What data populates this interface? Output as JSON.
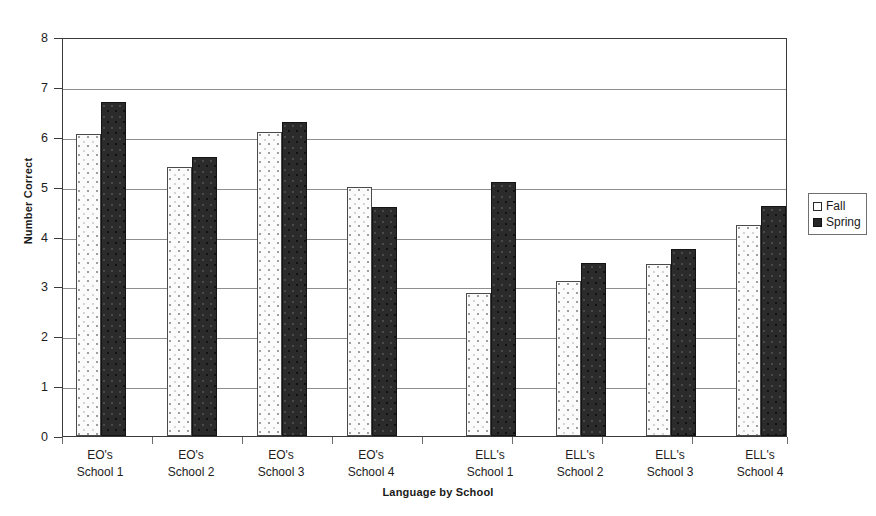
{
  "chart_data": {
    "type": "bar",
    "title": "",
    "xlabel": "Language by School",
    "ylabel": "Number Correct",
    "ylim": [
      0,
      8
    ],
    "yticks": [
      0,
      1,
      2,
      3,
      4,
      5,
      6,
      7,
      8
    ],
    "grid": true,
    "legend_position": "right",
    "categories": [
      "EO's School 1",
      "EO's School 2",
      "EO's School 3",
      "EO's School 4",
      "ELL's School 1",
      "ELL's School 2",
      "ELL's School 3",
      "ELL's School 4"
    ],
    "category_lines": [
      {
        "line1": "EO's",
        "line2": "School 1"
      },
      {
        "line1": "EO's",
        "line2": "School 2"
      },
      {
        "line1": "EO's",
        "line2": "School 3"
      },
      {
        "line1": "EO's",
        "line2": "School 4"
      },
      {
        "line1": "ELL's",
        "line2": "School 1"
      },
      {
        "line1": "ELL's",
        "line2": "School 2"
      },
      {
        "line1": "ELL's",
        "line2": "School 3"
      },
      {
        "line1": "ELL's",
        "line2": "School 4"
      }
    ],
    "series": [
      {
        "name": "Fall",
        "color": "#fbfbfb",
        "pattern": "dotted",
        "values": [
          6.05,
          5.4,
          6.1,
          5.0,
          2.87,
          3.1,
          3.44,
          4.23
        ]
      },
      {
        "name": "Spring",
        "color": "#2b2b2b",
        "pattern": "solid",
        "values": [
          6.7,
          5.6,
          6.3,
          4.6,
          5.1,
          3.47,
          3.75,
          4.62
        ]
      }
    ]
  },
  "legend": {
    "items": [
      {
        "label": "Fall"
      },
      {
        "label": "Spring"
      }
    ]
  },
  "axes": {
    "y_tick_labels": [
      "8",
      "7",
      "6",
      "5",
      "4",
      "3",
      "2",
      "1",
      "0"
    ]
  }
}
